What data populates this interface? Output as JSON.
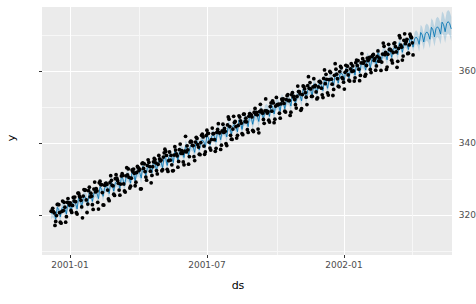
{
  "chart_data": {
    "type": "scatter",
    "title": "",
    "subtitle": "",
    "xlabel": "ds",
    "ylabel": "y",
    "grid": true,
    "legend": "none",
    "xlim": [
      "2000-12-20",
      "2002-06-10"
    ],
    "ylim": [
      305,
      374
    ],
    "x_tick_labels": [
      "2001-01",
      "2001-07",
      "2002-01"
    ],
    "x_tick_values": [
      "2001-01-01",
      "2001-07-01",
      "2002-01-01"
    ],
    "y_tick_labels": [
      "320",
      "340",
      "360"
    ],
    "y_tick_values": [
      320,
      340,
      360
    ],
    "y_minor_gridlines": [
      310,
      330,
      350,
      370
    ],
    "series": [
      {
        "name": "y",
        "kind": "scatter-observed",
        "marker": "circle",
        "color": "#000000",
        "size": 3.0,
        "description": "Daily observations from 2001-01-01 through 2002-04-20, rising trend with weekly seasonality."
      },
      {
        "name": "yhat",
        "kind": "line-forecast",
        "color": "#0072B2",
        "width": 1.0,
        "description": "Prophet trend/forecast line across history and future."
      },
      {
        "name": "yhat_interval",
        "kind": "band-uncertainty",
        "color": "#0072B2",
        "opacity": 0.2,
        "description": "Uncertainty interval ribbon, widening into the future region."
      }
    ],
    "observed": {
      "start_date": "2001-01-01",
      "end_date": "2002-04-20",
      "n_points": 475,
      "y_start": 316.0,
      "y_end": 364.5,
      "trend_slope_per_day": 0.1022,
      "weekly_amplitude": 2.6,
      "noise_sd": 1.1
    },
    "forecast": {
      "start_date": "2002-04-21",
      "end_date": "2002-06-10",
      "yhat_start": 365.0,
      "yhat_end": 370.4,
      "interval_half_width_start": 1.8,
      "interval_half_width_end": 3.4
    },
    "style": {
      "panel_background": "#ebebeb",
      "major_gridline": "#ffffff",
      "minor_gridline": "#f7f7f7",
      "figure_background": "#ffffff",
      "tick_text": "#4d4d4d",
      "axis_title": "#000000"
    }
  }
}
